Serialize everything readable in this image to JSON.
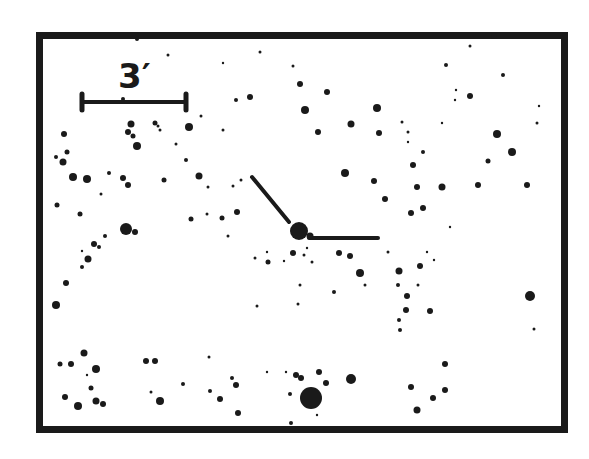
{
  "chart": {
    "type": "finder-chart",
    "frame": {
      "x": 36,
      "y": 32,
      "width": 532,
      "height": 401,
      "border": 7,
      "color": "#1a1a1a"
    },
    "scale_bar": {
      "label": "3′",
      "x1": 82,
      "x2": 186,
      "y": 102,
      "label_x": 124,
      "label_y": 92
    }
  },
  "target": {
    "x": 299,
    "y": 231,
    "r": 9,
    "marker_diag": {
      "x1": 252,
      "y1": 177,
      "x2": 289,
      "y2": 222
    },
    "marker_horiz": {
      "x1": 309,
      "y1": 238,
      "x2": 378,
      "y2": 238
    }
  },
  "stars": [
    [
      137,
      39,
      2
    ],
    [
      168,
      55,
      1.5
    ],
    [
      223,
      63,
      1.2
    ],
    [
      260,
      52,
      1.5
    ],
    [
      293,
      66,
      1.5
    ],
    [
      300,
      84,
      3
    ],
    [
      327,
      92,
      3
    ],
    [
      305,
      110,
      4
    ],
    [
      318,
      132,
      3
    ],
    [
      351,
      124,
      3.5
    ],
    [
      377,
      108,
      4
    ],
    [
      379,
      133,
      3
    ],
    [
      402,
      122,
      1.5
    ],
    [
      408,
      132,
      1.5
    ],
    [
      250,
      97,
      3
    ],
    [
      236,
      100,
      2
    ],
    [
      123,
      99,
      2
    ],
    [
      189,
      127,
      4
    ],
    [
      160,
      130,
      1.5
    ],
    [
      201,
      116,
      1.5
    ],
    [
      223,
      130,
      1.5
    ],
    [
      131,
      124,
      3.5
    ],
    [
      128,
      132,
      3
    ],
    [
      133,
      136,
      2.5
    ],
    [
      137,
      146,
      4
    ],
    [
      155,
      123,
      2.5
    ],
    [
      158,
      126,
      1.5
    ],
    [
      176,
      144,
      1.5
    ],
    [
      186,
      160,
      2
    ],
    [
      64,
      134,
      3
    ],
    [
      67,
      152,
      2.5
    ],
    [
      56,
      157,
      2
    ],
    [
      63,
      162,
      3.5
    ],
    [
      470,
      46,
      1.5
    ],
    [
      494,
      36,
      3
    ],
    [
      446,
      65,
      2
    ],
    [
      503,
      75,
      2
    ],
    [
      456,
      90,
      1.2
    ],
    [
      455,
      100,
      1.2
    ],
    [
      470,
      96,
      3
    ],
    [
      442,
      123,
      1.2
    ],
    [
      497,
      134,
      4
    ],
    [
      539,
      106,
      1.2
    ],
    [
      537,
      123,
      1.5
    ],
    [
      408,
      142,
      1.2
    ],
    [
      423,
      152,
      2
    ],
    [
      413,
      165,
      3
    ],
    [
      512,
      152,
      4
    ],
    [
      527,
      185,
      3
    ],
    [
      73,
      177,
      4
    ],
    [
      87,
      179,
      4
    ],
    [
      109,
      173,
      2
    ],
    [
      123,
      178,
      3
    ],
    [
      128,
      185,
      3
    ],
    [
      101,
      194,
      1.5
    ],
    [
      57,
      205,
      2.5
    ],
    [
      80,
      214,
      2.5
    ],
    [
      105,
      236,
      2
    ],
    [
      126,
      229,
      6
    ],
    [
      135,
      232,
      3
    ],
    [
      82,
      267,
      2
    ],
    [
      94,
      244,
      3
    ],
    [
      99,
      247,
      2
    ],
    [
      82,
      251,
      1.2
    ],
    [
      88,
      259,
      3.5
    ],
    [
      66,
      283,
      3
    ],
    [
      56,
      305,
      4
    ],
    [
      199,
      176,
      3.5
    ],
    [
      208,
      187,
      1.5
    ],
    [
      233,
      186,
      1.5
    ],
    [
      222,
      218,
      2.5
    ],
    [
      207,
      214,
      1.5
    ],
    [
      237,
      212,
      3
    ],
    [
      228,
      236,
      1.5
    ],
    [
      241,
      180,
      1.5
    ],
    [
      164,
      180,
      2.5
    ],
    [
      191,
      219,
      2.5
    ],
    [
      345,
      173,
      4
    ],
    [
      374,
      181,
      3
    ],
    [
      385,
      199,
      3
    ],
    [
      388,
      252,
      1.5
    ],
    [
      411,
      213,
      3
    ],
    [
      417,
      187,
      3
    ],
    [
      423,
      208,
      3
    ],
    [
      442,
      187,
      3.5
    ],
    [
      478,
      185,
      3
    ],
    [
      488,
      161,
      2.5
    ],
    [
      450,
      227,
      1.2
    ],
    [
      255,
      258,
      1.5
    ],
    [
      267,
      252,
      1.2
    ],
    [
      284,
      261,
      1.2
    ],
    [
      310,
      236,
      3.5
    ],
    [
      293,
      253,
      3
    ],
    [
      304,
      255,
      1.5
    ],
    [
      257,
      306,
      1.5
    ],
    [
      307,
      248,
      1.2
    ],
    [
      268,
      262,
      2.5
    ],
    [
      339,
      253,
      3
    ],
    [
      350,
      256,
      3
    ],
    [
      360,
      273,
      4
    ],
    [
      399,
      271,
      3.5
    ],
    [
      398,
      285,
      2
    ],
    [
      407,
      296,
      3
    ],
    [
      365,
      285,
      1.5
    ],
    [
      399,
      320,
      2
    ],
    [
      334,
      292,
      2
    ],
    [
      300,
      285,
      1.5
    ],
    [
      298,
      304,
      1.5
    ],
    [
      312,
      262,
      1.5
    ],
    [
      420,
      266,
      3
    ],
    [
      418,
      285,
      1.5
    ],
    [
      427,
      252,
      1.2
    ],
    [
      434,
      260,
      1.2
    ],
    [
      530,
      296,
      5
    ],
    [
      534,
      329,
      1.5
    ],
    [
      400,
      330,
      2
    ],
    [
      406,
      310,
      3
    ],
    [
      430,
      311,
      3
    ],
    [
      445,
      364,
      3
    ],
    [
      411,
      387,
      3
    ],
    [
      433,
      398,
      3
    ],
    [
      445,
      390,
      3
    ],
    [
      417,
      410,
      3.5
    ],
    [
      60,
      364,
      2.5
    ],
    [
      71,
      364,
      3
    ],
    [
      84,
      353,
      3.5
    ],
    [
      96,
      369,
      4
    ],
    [
      65,
      397,
      3
    ],
    [
      91,
      388,
      2.5
    ],
    [
      87,
      375,
      1.2
    ],
    [
      78,
      406,
      4
    ],
    [
      96,
      401,
      3.5
    ],
    [
      103,
      404,
      3
    ],
    [
      146,
      361,
      3
    ],
    [
      155,
      361,
      3
    ],
    [
      151,
      392,
      1.5
    ],
    [
      160,
      401,
      4
    ],
    [
      183,
      384,
      2
    ],
    [
      209,
      357,
      1.5
    ],
    [
      210,
      391,
      2
    ],
    [
      232,
      378,
      2
    ],
    [
      236,
      385,
      3
    ],
    [
      238,
      413,
      3
    ],
    [
      220,
      399,
      3
    ],
    [
      267,
      372,
      1.2
    ],
    [
      286,
      372,
      1.2
    ],
    [
      296,
      375,
      3
    ],
    [
      301,
      378,
      3
    ],
    [
      319,
      372,
      3
    ],
    [
      326,
      383,
      3
    ],
    [
      311,
      398,
      11
    ],
    [
      290,
      394,
      2
    ],
    [
      317,
      415,
      1.2
    ],
    [
      351,
      379,
      5
    ],
    [
      291,
      423,
      2
    ]
  ]
}
